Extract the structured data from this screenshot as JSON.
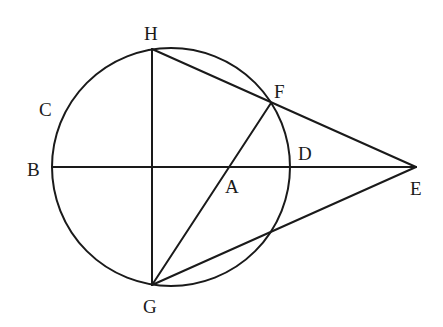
{
  "diagram": {
    "type": "geometry",
    "circle": {
      "cx": 171,
      "cy": 167,
      "r": 119
    },
    "points": {
      "H": {
        "x": 152,
        "y": 49,
        "label": "H"
      },
      "G": {
        "x": 152,
        "y": 285,
        "label": "G"
      },
      "B": {
        "x": 52,
        "y": 167,
        "label": "B"
      },
      "C": {
        "x": 62,
        "y": 118,
        "label": "C"
      },
      "D": {
        "x": 290,
        "y": 167,
        "label": "D"
      },
      "E": {
        "x": 416,
        "y": 167,
        "label": "E"
      },
      "F": {
        "x": 271,
        "y": 103,
        "label": "F"
      },
      "A": {
        "x": 229,
        "y": 167,
        "label": "A"
      }
    },
    "segments": [
      {
        "name": "BE",
        "from": "B",
        "to": "E"
      },
      {
        "name": "HG",
        "from": "H",
        "to": "G"
      },
      {
        "name": "HE",
        "from": "H",
        "to": "E"
      },
      {
        "name": "GF",
        "from": "G",
        "to": "F"
      },
      {
        "name": "GE",
        "from": "G",
        "to": "E"
      }
    ],
    "labels": {
      "H": "H",
      "C": "C",
      "B": "B",
      "F": "F",
      "D": "D",
      "A": "A",
      "E": "E",
      "G": "G"
    },
    "stroke_color": "#1a1a1a",
    "background": "#ffffff"
  }
}
